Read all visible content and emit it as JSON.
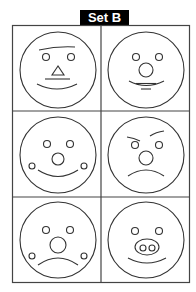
{
  "title": "Set B",
  "colors": {
    "title_bg": "#000000",
    "title_text": "#ffffff",
    "line": "#333333",
    "background": "#ffffff"
  },
  "grid": {
    "rows": 3,
    "cols": 2
  },
  "faces": [
    {
      "id": 1,
      "row": 1,
      "col": 1,
      "features": [
        "slanted-brow-line",
        "two-eyes",
        "triangle-nose",
        "mouth-line",
        "smile"
      ]
    },
    {
      "id": 2,
      "row": 1,
      "col": 2,
      "features": [
        "two-eyes",
        "round-nose",
        "smile",
        "mouth-line",
        "chin-line"
      ]
    },
    {
      "id": 3,
      "row": 2,
      "col": 1,
      "features": [
        "two-eyes",
        "round-nose",
        "cheek-dots",
        "smile"
      ]
    },
    {
      "id": 4,
      "row": 2,
      "col": 2,
      "features": [
        "angry-brows",
        "two-eyes",
        "round-nose",
        "frown"
      ]
    },
    {
      "id": 5,
      "row": 3,
      "col": 1,
      "features": [
        "two-eyes",
        "large-round-nose",
        "cheek-dots",
        "frown"
      ]
    },
    {
      "id": 6,
      "row": 3,
      "col": 2,
      "features": [
        "two-eyes",
        "pig-snout",
        "smile"
      ]
    }
  ]
}
